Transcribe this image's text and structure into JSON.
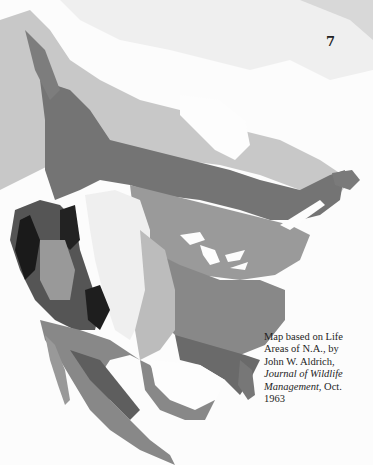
{
  "page": {
    "number": "7"
  },
  "map": {
    "subject": "Life areas of North America",
    "palette": {
      "background": "#fcfcfc",
      "arctic": "#e6e6e6",
      "tundra_light": "#c9c9c9",
      "boreal": "#7a7a7a",
      "transition": "#a9a9a9",
      "deciduous": "#8e8e8e",
      "grassland": "#efefef",
      "prairie": "#bdbdbd",
      "southeast": "#6f6f6f",
      "mountain": "#1a1a1a",
      "desert": "#9c9c9c",
      "water": "#ffffff"
    }
  },
  "caption": {
    "line1": "Map based on Life",
    "line2": "Areas of N.A., by",
    "line3": "John W. Aldrich,",
    "journal": "Journal of Wildlife",
    "journal2": "Management",
    "date_suffix": ", Oct.",
    "year": "1963"
  }
}
